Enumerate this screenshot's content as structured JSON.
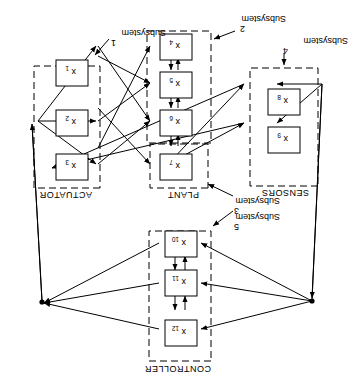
{
  "figure": {
    "orientation_degrees": 180,
    "background_color": "#ffffff",
    "line_color": "#000000",
    "groups": [
      {
        "id": "controller",
        "label": "CONTROLLER"
      },
      {
        "id": "plant",
        "label": "PLANT"
      },
      {
        "id": "sensors",
        "label": "SENSORS"
      },
      {
        "id": "actuator",
        "label": "ACTUATOR"
      }
    ],
    "subsystems": [
      {
        "id": "s1",
        "line1": "Subsystem",
        "line2": "1"
      },
      {
        "id": "s2",
        "line1": "Subsystem",
        "line2": "2"
      },
      {
        "id": "s3",
        "line1": "Subsystem",
        "line2": "3"
      },
      {
        "id": "s4",
        "line1": "Subsystem",
        "line2": "4"
      },
      {
        "id": "s5",
        "line1": "Subsystem",
        "line2": "5"
      }
    ],
    "nodes": [
      {
        "id": "x1",
        "base": "x",
        "sub": "1"
      },
      {
        "id": "x2",
        "base": "x",
        "sub": "2"
      },
      {
        "id": "x3",
        "base": "x",
        "sub": "3"
      },
      {
        "id": "x4",
        "base": "x",
        "sub": "4"
      },
      {
        "id": "x5",
        "base": "x",
        "sub": "5"
      },
      {
        "id": "x6",
        "base": "x",
        "sub": "6"
      },
      {
        "id": "x7",
        "base": "x",
        "sub": "7"
      },
      {
        "id": "x8",
        "base": "x",
        "sub": "8"
      },
      {
        "id": "x9",
        "base": "x",
        "sub": "9"
      },
      {
        "id": "x10",
        "base": "x",
        "sub": "10"
      },
      {
        "id": "x11",
        "base": "x",
        "sub": "11"
      },
      {
        "id": "x12",
        "base": "x",
        "sub": "12"
      }
    ]
  }
}
